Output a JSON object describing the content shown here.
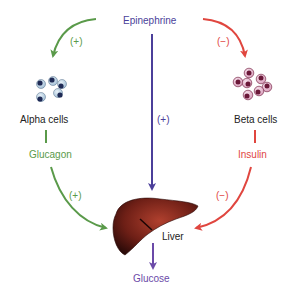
{
  "colors": {
    "epinephrine": "#4b3f9a",
    "glucagon": "#5a9a4a",
    "insulin": "#e0463f",
    "glucose": "#6b4aa8",
    "text": "#222222",
    "liver": "#7a2418",
    "alpha_cell_fill": "#c8dcea",
    "alpha_cell_nucleus": "#1e2a55",
    "beta_cell_fill": "#ecc4d6",
    "beta_cell_nucleus": "#6a1838"
  },
  "labels": {
    "epinephrine": "Epinephrine",
    "alpha_cells": "Alpha cells",
    "beta_cells": "Beta cells",
    "glucagon": "Glucagon",
    "insulin": "Insulin",
    "liver": "Liver",
    "glucose": "Glucose"
  },
  "signs": {
    "epi_to_alpha": "(+)",
    "epi_to_beta": "(−)",
    "epi_to_liver": "(+)",
    "glucagon_to_liver": "(+)",
    "insulin_to_liver": "(−)"
  }
}
